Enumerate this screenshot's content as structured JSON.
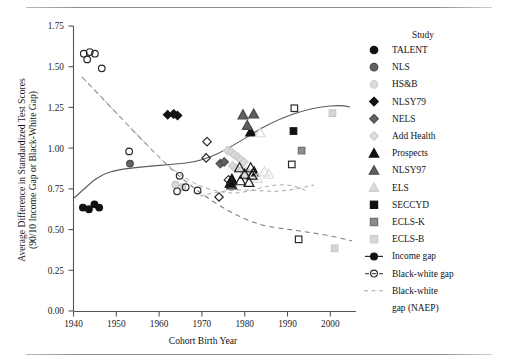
{
  "chart_data": {
    "type": "scatter",
    "title": "",
    "xlabel": "Cohort Birth Year",
    "ylabel": "Average Difference in Standardized Test Scores (90/10 Income Gap or Black-White Gap)",
    "ylabel_line1": "Average Difference in Standardized Test Scores",
    "ylabel_line2": "(90/10 Income Gap or Black-White Gap)",
    "xlim": [
      1938,
      2004
    ],
    "ylim": [
      0.0,
      1.75
    ],
    "xticks": [
      1940,
      1950,
      1960,
      1970,
      1980,
      1990,
      2000
    ],
    "yticks": [
      "0.00",
      "0.25",
      "0.50",
      "0.75",
      "1.00",
      "1.25",
      "1.50",
      "1.75"
    ],
    "grid": false,
    "legend_position": "right",
    "legend_title": "Study",
    "series": [
      {
        "name": "TALENT",
        "marker": "circle",
        "fill": "#111111",
        "edge": "#111111",
        "size": 7.2,
        "points": [
          {
            "x": 1942.2,
            "y": 0.635
          },
          {
            "x": 1943.6,
            "y": 0.625
          },
          {
            "x": 1944.9,
            "y": 0.655
          },
          {
            "x": 1946.0,
            "y": 0.635
          }
        ]
      },
      {
        "name": "NLS",
        "marker": "circle",
        "fill": "#636363",
        "edge": "#4a4a4a",
        "size": 7.2,
        "points": [
          {
            "x": 1953.2,
            "y": 0.905
          }
        ]
      },
      {
        "name": "HS&B",
        "marker": "circle",
        "fill": "#d8d8d8",
        "edge": "#c4c4c4",
        "size": 7.2,
        "points": [
          {
            "x": 1963.8,
            "y": 0.775
          },
          {
            "x": 1965.4,
            "y": 0.76
          }
        ]
      },
      {
        "name": "NLSY79",
        "marker": "diamond",
        "fill": "#111111",
        "edge": "#111111",
        "size": 8.0,
        "points": [
          {
            "x": 1962.0,
            "y": 1.205
          },
          {
            "x": 1963.4,
            "y": 1.21
          },
          {
            "x": 1964.3,
            "y": 1.2
          }
        ]
      },
      {
        "name": "NELS",
        "marker": "diamond",
        "fill": "#636363",
        "edge": "#4a4a4a",
        "size": 8.0,
        "points": [
          {
            "x": 1974.3,
            "y": 0.905
          },
          {
            "x": 1975.2,
            "y": 0.915
          }
        ]
      },
      {
        "name": "Add Health",
        "marker": "diamond",
        "fill": "#dcdcdc",
        "edge": "#cbcbcb",
        "size": 8.0,
        "points": [
          {
            "x": 1976.0,
            "y": 0.985
          },
          {
            "x": 1976.9,
            "y": 0.975
          },
          {
            "x": 1977.6,
            "y": 0.96
          },
          {
            "x": 1978.4,
            "y": 0.945
          },
          {
            "x": 1979.0,
            "y": 0.93
          },
          {
            "x": 1979.8,
            "y": 0.915
          },
          {
            "x": 1977.2,
            "y": 0.89
          },
          {
            "x": 1978.0,
            "y": 0.875
          },
          {
            "x": 1979.4,
            "y": 0.865
          },
          {
            "x": 1980.4,
            "y": 0.855
          },
          {
            "x": 1981.2,
            "y": 0.845
          },
          {
            "x": 1980.0,
            "y": 0.83
          }
        ]
      },
      {
        "name": "Prospects",
        "marker": "triangle",
        "fill": "#111111",
        "edge": "#111111",
        "size": 8.6,
        "points": [
          {
            "x": 1981.4,
            "y": 1.1
          },
          {
            "x": 1982.2,
            "y": 0.855
          },
          {
            "x": 1977.0,
            "y": 0.81
          },
          {
            "x": 1976.6,
            "y": 0.785
          }
        ]
      },
      {
        "name": "NLSY97",
        "marker": "triangle",
        "fill": "#5f5f5f",
        "edge": "#4a4a4a",
        "size": 8.6,
        "points": [
          {
            "x": 1979.6,
            "y": 1.205
          },
          {
            "x": 1982.1,
            "y": 1.21
          },
          {
            "x": 1980.6,
            "y": 1.14
          }
        ]
      },
      {
        "name": "ELS",
        "marker": "triangle-open",
        "fill": "none",
        "edge": "#dadada",
        "size": 8.6,
        "points": [
          {
            "x": 1983.6,
            "y": 1.095
          },
          {
            "x": 1984.6,
            "y": 0.855
          },
          {
            "x": 1985.6,
            "y": 0.84
          },
          {
            "x": 1982.0,
            "y": 0.83
          },
          {
            "x": 1983.0,
            "y": 0.815
          }
        ]
      },
      {
        "name": "SECCYD",
        "marker": "square",
        "fill": "#111111",
        "edge": "#111111",
        "size": 7.4,
        "points": [
          {
            "x": 1991.4,
            "y": 1.105
          }
        ]
      },
      {
        "name": "ECLS-K",
        "marker": "square",
        "fill": "#8d8d8d",
        "edge": "#6f6f6f",
        "size": 7.4,
        "points": [
          {
            "x": 1993.3,
            "y": 0.985
          }
        ]
      },
      {
        "name": "ECLS-B",
        "marker": "square",
        "fill": "#d6d6d6",
        "edge": "#c8c8c8",
        "size": 7.4,
        "points": [
          {
            "x": 2000.5,
            "y": 1.215
          },
          {
            "x": 2001.0,
            "y": 0.385
          }
        ]
      },
      {
        "name": "Black-white gap (open circles)",
        "marker": "circle-open",
        "fill": "none",
        "edge": "#2b2b2b",
        "size": 7.2,
        "points": [
          {
            "x": 1942.4,
            "y": 1.58
          },
          {
            "x": 1943.8,
            "y": 1.59
          },
          {
            "x": 1945.0,
            "y": 1.58
          },
          {
            "x": 1943.2,
            "y": 1.545
          },
          {
            "x": 1946.6,
            "y": 1.49
          },
          {
            "x": 1953.0,
            "y": 0.98
          },
          {
            "x": 1964.8,
            "y": 0.83
          },
          {
            "x": 1966.2,
            "y": 0.76
          },
          {
            "x": 1964.2,
            "y": 0.735
          },
          {
            "x": 1969.0,
            "y": 0.74
          }
        ]
      },
      {
        "name": "Income gap open diamonds",
        "marker": "diamond-open",
        "fill": "none",
        "edge": "#2b2b2b",
        "size": 8.0,
        "points": [
          {
            "x": 1971.2,
            "y": 1.04
          },
          {
            "x": 1971.0,
            "y": 0.94
          },
          {
            "x": 1976.2,
            "y": 0.805
          },
          {
            "x": 1974.0,
            "y": 0.7
          }
        ]
      },
      {
        "name": "Income gap open triangles",
        "marker": "triangle-open-dark",
        "fill": "none",
        "edge": "#1c1c1c",
        "size": 8.6,
        "points": [
          {
            "x": 1978.8,
            "y": 0.88
          },
          {
            "x": 1981.4,
            "y": 0.88
          },
          {
            "x": 1980.0,
            "y": 0.84
          },
          {
            "x": 1981.7,
            "y": 0.835
          },
          {
            "x": 1979.0,
            "y": 0.8
          },
          {
            "x": 1981.0,
            "y": 0.79
          },
          {
            "x": 1977.0,
            "y": 0.775
          }
        ]
      },
      {
        "name": "Income gap open squares",
        "marker": "square-open",
        "fill": "none",
        "edge": "#2b2b2b",
        "size": 7.4,
        "points": [
          {
            "x": 1991.6,
            "y": 1.245
          },
          {
            "x": 1991.0,
            "y": 0.9
          },
          {
            "x": 1992.6,
            "y": 0.44
          }
        ]
      }
    ],
    "trend_lines": [
      {
        "name": "Income gap",
        "style": "solid",
        "color": "#5c5c5c"
      },
      {
        "name": "Black-white gap",
        "style": "dashed",
        "color": "#7d7d7d"
      },
      {
        "name": "Black-white gap (NAEP)",
        "style": "dashed-light",
        "color": "#a9a9a9"
      }
    ]
  },
  "axes": {
    "x_title": "Cohort Birth Year",
    "y_title_line1": "Average Difference in Standardized Test Scores",
    "y_title_line2": "(90/10 Income Gap or Black-White Gap)",
    "x_ticks": [
      "1940",
      "1950",
      "1960",
      "1970",
      "1980",
      "1990",
      "2000"
    ],
    "y_ticks": [
      "0.00",
      "0.25",
      "0.50",
      "0.75",
      "1.00",
      "1.25",
      "1.50",
      "1.75"
    ]
  },
  "legend": {
    "title": "Study",
    "items": [
      {
        "label": "TALENT",
        "marker": "circle-filled-black"
      },
      {
        "label": "NLS",
        "marker": "circle-filled-gray"
      },
      {
        "label": "HS&B",
        "marker": "circle-filled-light"
      },
      {
        "label": "NLSY79",
        "marker": "diamond-filled-black"
      },
      {
        "label": "NELS",
        "marker": "diamond-filled-gray"
      },
      {
        "label": "Add Health",
        "marker": "diamond-filled-light"
      },
      {
        "label": "Prospects",
        "marker": "triangle-filled-black"
      },
      {
        "label": "NLSY97",
        "marker": "triangle-filled-gray"
      },
      {
        "label": "ELS",
        "marker": "triangle-filled-light"
      },
      {
        "label": "SECCYD",
        "marker": "square-filled-black"
      },
      {
        "label": "ECLS-K",
        "marker": "square-filled-gray"
      },
      {
        "label": "ECLS-B",
        "marker": "square-filled-light"
      },
      {
        "label": "Income gap",
        "marker": "line-solid-circle-filled"
      },
      {
        "label": "Black-white gap",
        "marker": "line-dashed-circle-open"
      },
      {
        "label": "Black-white",
        "marker": "line-dashed-light"
      },
      {
        "label": "gap (NAEP)",
        "marker": "none"
      }
    ]
  },
  "colors": {
    "black": "#111111",
    "gray": "#636363",
    "light": "#d8d8d8",
    "curve": "#5c5c5c",
    "dashed": "#7d7d7d",
    "dashed_light": "#a9a9a9",
    "axis": "#555555"
  }
}
